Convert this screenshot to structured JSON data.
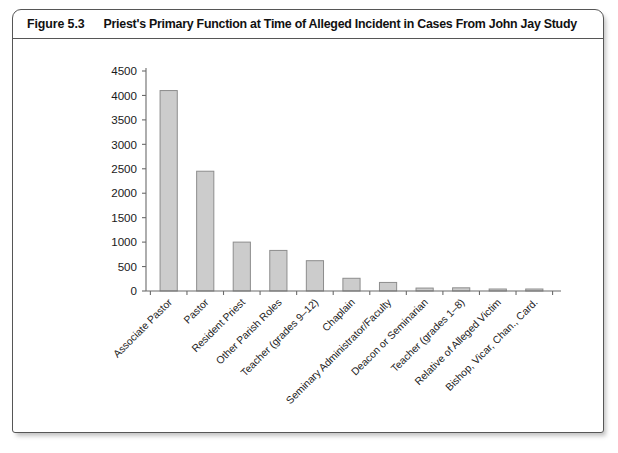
{
  "figure": {
    "number": "Figure 5.3",
    "title": "Priest's Primary Function at Time of Alleged Incident in Cases From John Jay Study"
  },
  "chart_data": {
    "type": "bar",
    "title": "Priest's Primary Function at Time of Alleged Incident in Cases From John Jay Study",
    "xlabel": "",
    "ylabel": "",
    "ylim": [
      0,
      4500
    ],
    "ytick_step": 500,
    "yticks": [
      0,
      500,
      1000,
      1500,
      2000,
      2500,
      3000,
      3500,
      4000,
      4500
    ],
    "ytick_labels": [
      "0",
      "500",
      "1000",
      "1500",
      "2000",
      "2500",
      "3000",
      "3500",
      "4000",
      "4500"
    ],
    "grid": false,
    "legend": null,
    "categories": [
      "Associate Pastor",
      "Pastor",
      "Resident Priest",
      "Other Parish Roles",
      "Teacher (grades 9–12)",
      "Chaplain",
      "Seminary Administrator/Faculty",
      "Deacon or Seminarian",
      "Teacher (grades 1–8)",
      "Relative of Alleged Victim",
      "Bishop, Vicar, Chan., Card."
    ],
    "values": [
      4100,
      2450,
      1000,
      830,
      620,
      260,
      175,
      60,
      65,
      35,
      35
    ],
    "bar_fill": "#cccccc",
    "bar_edge": "#8d8d8d",
    "axis_color": "#6b6b6b"
  }
}
